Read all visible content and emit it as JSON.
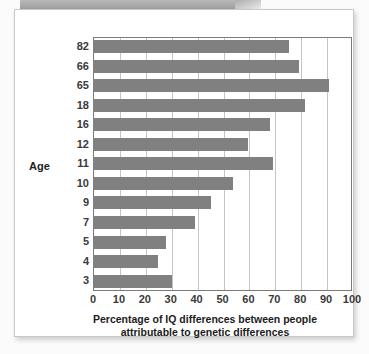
{
  "chart_data": {
    "type": "bar",
    "orientation": "horizontal",
    "title": "",
    "xlabel_lines": [
      "Percentage of IQ differences between people",
      "attributable to genetic differences"
    ],
    "ylabel": "Age",
    "categories": [
      "82",
      "66",
      "65",
      "18",
      "16",
      "12",
      "11",
      "10",
      "9",
      "7",
      "5",
      "4",
      "3"
    ],
    "values": [
      75.5,
      79.5,
      91,
      82,
      68.5,
      60,
      69.5,
      54,
      45.5,
      39.5,
      28,
      25,
      30.5
    ],
    "xlim": [
      0,
      100
    ],
    "xticks": [
      0,
      10,
      20,
      30,
      40,
      50,
      60,
      70,
      80,
      90,
      100
    ],
    "xtick_labels": [
      "0",
      "10",
      "20",
      "30",
      "40",
      "50",
      "60",
      "70",
      "80",
      "90",
      "100"
    ],
    "grid": "vertical",
    "legend": null,
    "bar_color": "#808080",
    "gridline_color": "#c4c4c4",
    "frame_color": "#7a7a7a"
  }
}
